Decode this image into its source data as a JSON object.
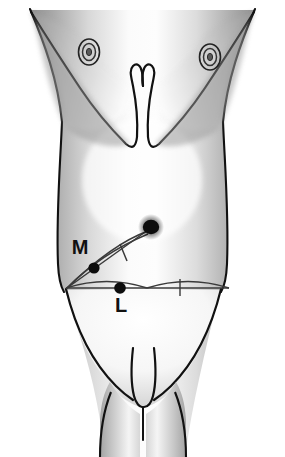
{
  "figure": {
    "type": "anatomical-line-drawing",
    "view": "anterior",
    "background_color": "#ffffff",
    "outline_color": "#111111",
    "shading_color": "#8f8f8f",
    "marker_color": "#0d0d0d"
  },
  "labels": {
    "midpoint_label": "M",
    "landmark_label": "L"
  },
  "landmarks": [
    {
      "id": "umbilicus",
      "name": "umbilicus",
      "marker": "filled-dot",
      "cx": 151,
      "cy": 227,
      "r": 7.5
    },
    {
      "id": "midpoint-m",
      "name": "midpoint of oblique line",
      "marker": "filled-dot",
      "cx": 94,
      "cy": 268,
      "r": 5.5,
      "label": "M"
    },
    {
      "id": "landmark-l",
      "name": "midpoint of transverse line",
      "marker": "filled-dot",
      "cx": 120,
      "cy": 287,
      "r": 5.5,
      "label": "L"
    },
    {
      "id": "asis-left",
      "name": "left anterior superior iliac spine",
      "marker": "line-end",
      "cx": 66,
      "cy": 288
    },
    {
      "id": "asis-right",
      "name": "right anterior superior iliac spine",
      "marker": "line-end",
      "cx": 229,
      "cy": 288
    }
  ],
  "measurement_lines": [
    {
      "id": "oblique-line",
      "name": "oblique line umbilicus to anterior superior iliac spine",
      "from": "umbilicus",
      "to": "asis-left",
      "x1": 151,
      "y1": 227,
      "x2": 66,
      "y2": 288,
      "tick_at_midpoint": true,
      "tick_label": "M"
    },
    {
      "id": "transverse-line",
      "name": "transverse interspinous line",
      "from": "asis-left",
      "to": "asis-right",
      "x1": 66,
      "y1": 288,
      "x2": 229,
      "y2": 288,
      "tick_at_midpoint": true,
      "tick_label": "L"
    }
  ],
  "anatomy_parts": [
    {
      "id": "torso",
      "name": "torso outline"
    },
    {
      "id": "nipple-left",
      "name": "left nipple and areola",
      "cx": 89,
      "cy": 52
    },
    {
      "id": "nipple-right",
      "name": "right nipple and areola",
      "cx": 210,
      "cy": 57
    },
    {
      "id": "costal-margin",
      "name": "costal margin"
    },
    {
      "id": "xiphoid-notch",
      "name": "xiphisternal notch"
    },
    {
      "id": "inguinal-folds",
      "name": "inguinal folds"
    },
    {
      "id": "genitalia",
      "name": "external genitalia"
    },
    {
      "id": "thigh-left",
      "name": "left thigh"
    },
    {
      "id": "thigh-right",
      "name": "right thigh"
    }
  ]
}
